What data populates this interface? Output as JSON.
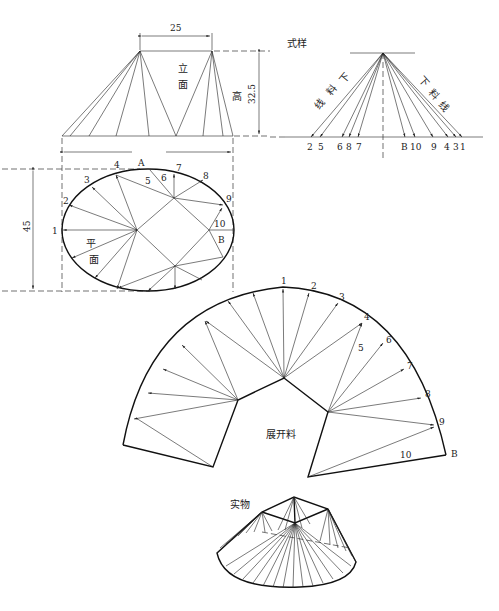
{
  "elevation": {
    "title_lines": [
      "立",
      "面"
    ],
    "height_label": "高",
    "top_width_dim": "25",
    "height_dim": "32.5"
  },
  "true_length": {
    "title": "式样",
    "left_label": [
      "下",
      "料",
      "线"
    ],
    "right_label": [
      "下",
      "料",
      "线"
    ],
    "points": [
      "2",
      "5",
      "6",
      "8",
      "7",
      "B",
      "10",
      "9",
      "4",
      "3",
      "1"
    ]
  },
  "plan": {
    "title_lines": [
      "平",
      "面"
    ],
    "depth_dim": "45",
    "points": {
      "p1": "1",
      "p2": "2",
      "p3": "3",
      "p4": "4",
      "pA": "A",
      "p5": "5",
      "p6": "6",
      "p7": "7",
      "p8": "8",
      "p9": "9",
      "p10": "10",
      "pB": "B"
    }
  },
  "development": {
    "title": "展开料",
    "points": {
      "p1": "1",
      "p2": "2",
      "p3": "3",
      "p4": "4",
      "p5": "5",
      "p6": "6",
      "p7": "7",
      "p8": "8",
      "p9": "9",
      "p10": "10",
      "pB": "B"
    }
  },
  "object": {
    "title": "实物"
  }
}
